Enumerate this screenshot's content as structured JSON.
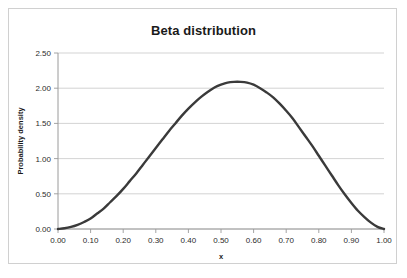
{
  "chart_data": {
    "type": "line",
    "title": "Beta distribution",
    "xlabel": "x",
    "ylabel": "Probability density",
    "xlim": [
      0.0,
      1.0
    ],
    "ylim": [
      0.0,
      2.5
    ],
    "grid": true,
    "legend": "none",
    "curve_color": "#3a3a3a",
    "gridline_color": "#c8c8c8",
    "axis_color": "#9a9a9a",
    "distribution": {
      "name": "Beta",
      "alpha": 3.4,
      "beta": 3.0,
      "mode_x": 0.6,
      "peak_density": 2.08
    },
    "xticks": [
      "0.00",
      "0.10",
      "0.20",
      "0.30",
      "0.40",
      "0.50",
      "0.60",
      "0.70",
      "0.80",
      "0.90",
      "1.00"
    ],
    "xtick_values": [
      0.0,
      0.1,
      0.2,
      0.3,
      0.4,
      0.5,
      0.6,
      0.7,
      0.8,
      0.9,
      1.0
    ],
    "yticks": [
      "0.00",
      "0.50",
      "1.00",
      "1.50",
      "2.00",
      "2.50"
    ],
    "ytick_values": [
      0.0,
      0.5,
      1.0,
      1.5,
      2.0,
      2.5
    ],
    "x": [
      0.0,
      0.02,
      0.04,
      0.06,
      0.08,
      0.1,
      0.12,
      0.14,
      0.16,
      0.18,
      0.2,
      0.22,
      0.24,
      0.26,
      0.28,
      0.3,
      0.32,
      0.34,
      0.36,
      0.38,
      0.4,
      0.42,
      0.44,
      0.46,
      0.48,
      0.5,
      0.52,
      0.54,
      0.56,
      0.58,
      0.6,
      0.62,
      0.64,
      0.66,
      0.68,
      0.7,
      0.72,
      0.74,
      0.76,
      0.78,
      0.8,
      0.82,
      0.84,
      0.86,
      0.88,
      0.9,
      0.92,
      0.94,
      0.96,
      0.98,
      1.0
    ],
    "values": [
      0.0,
      0.01,
      0.03,
      0.06,
      0.1,
      0.15,
      0.22,
      0.29,
      0.38,
      0.47,
      0.57,
      0.68,
      0.79,
      0.91,
      1.03,
      1.15,
      1.27,
      1.39,
      1.5,
      1.61,
      1.71,
      1.8,
      1.88,
      1.95,
      2.01,
      2.05,
      2.08,
      2.09,
      2.09,
      2.08,
      2.05,
      2.0,
      1.94,
      1.87,
      1.78,
      1.68,
      1.57,
      1.44,
      1.31,
      1.18,
      1.04,
      0.9,
      0.76,
      0.62,
      0.49,
      0.37,
      0.26,
      0.17,
      0.09,
      0.03,
      0.0
    ]
  }
}
